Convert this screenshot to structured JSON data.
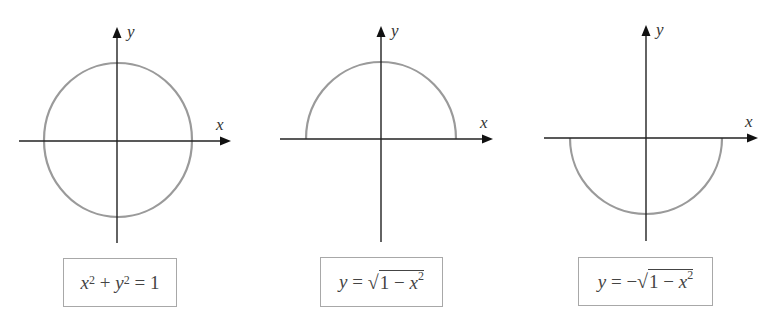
{
  "figure": {
    "panels": [
      {
        "id": "full-circle",
        "x_label": "x",
        "y_label": "y",
        "equation": {
          "text": "x^2 + y^2 = 1",
          "lhs_var1": "x",
          "exp1": "2",
          "plus": " + ",
          "lhs_var2": "y",
          "exp2": "2",
          "eq": " = ",
          "rhs": "1"
        },
        "curve": "circle"
      },
      {
        "id": "upper-semicircle",
        "x_label": "x",
        "y_label": "y",
        "equation": {
          "text": "y = √(1 − x^2)",
          "lhs": "y",
          "eq": " = ",
          "sign": "",
          "radical": "√",
          "rad_one": "1",
          "minus": " − ",
          "rad_var": "x",
          "exp": "2"
        },
        "curve": "upper semicircle"
      },
      {
        "id": "lower-semicircle",
        "x_label": "x",
        "y_label": "y",
        "equation": {
          "text": "y = −√(1 − x^2)",
          "lhs": "y",
          "eq": " = ",
          "sign": "−",
          "radical": "√",
          "rad_one": "1",
          "minus": " − ",
          "rad_var": "x",
          "exp": "2"
        },
        "curve": "lower semicircle"
      }
    ],
    "colors": {
      "axis": "#222222",
      "curve": "#9a9a9a",
      "box_border": "#a8a8a8",
      "text": "#444444"
    }
  }
}
